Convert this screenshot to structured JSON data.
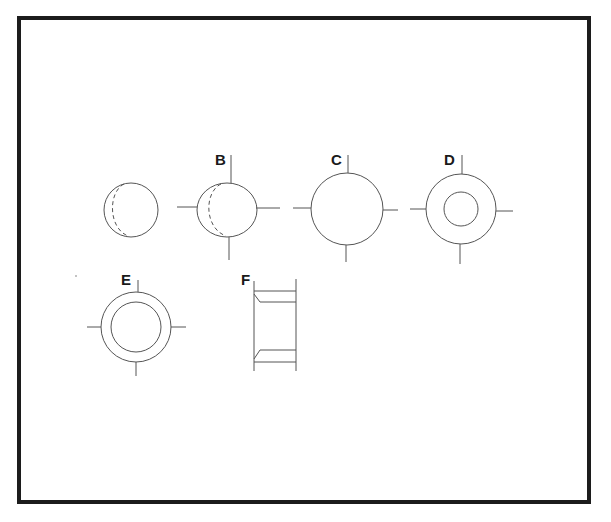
{
  "diagram": {
    "stroke_color": "#555555",
    "frame_color": "#1c1c1c",
    "figures": [
      {
        "id": "unlabeled",
        "label": "",
        "shape": "sphere-with-dashed-crescent",
        "axes": false
      },
      {
        "id": "B",
        "label": "B",
        "shape": "sphere-with-dashed-crescent",
        "axes": true
      },
      {
        "id": "C",
        "label": "C",
        "shape": "circle",
        "axes": true
      },
      {
        "id": "D",
        "label": "D",
        "shape": "ring-small-inner",
        "axes": true
      },
      {
        "id": "E",
        "label": "E",
        "shape": "ring-large-inner",
        "axes": true
      },
      {
        "id": "F",
        "label": "F",
        "shape": "cylinder-side-view-flanged",
        "axes": false
      }
    ]
  }
}
